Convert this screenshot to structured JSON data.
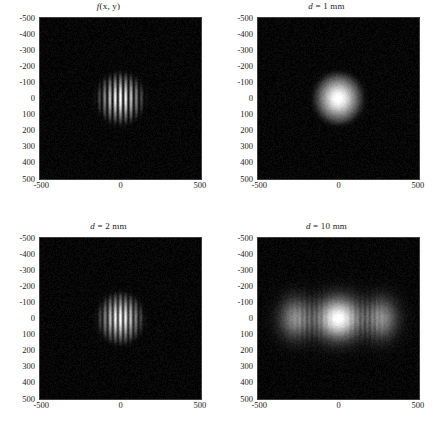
{
  "figure": {
    "layout": "2x2-grid",
    "width": 435,
    "height": 440,
    "background_color": "#ffffff",
    "colormap": "grayscale",
    "axis_color": "#1a1a1a"
  },
  "axes": {
    "x_ticks": [
      "-500",
      "0",
      "500"
    ],
    "x_tick_values": [
      -500,
      0,
      500
    ],
    "y_ticks": [
      "-500",
      "-400",
      "-300",
      "-200",
      "-100",
      "0",
      "100",
      "200",
      "300",
      "400",
      "500"
    ],
    "y_tick_values": [
      -500,
      -400,
      -300,
      -200,
      -100,
      0,
      100,
      200,
      300,
      400,
      500
    ],
    "xlim": [
      -500,
      500
    ],
    "ylim": [
      -500,
      500
    ],
    "y_direction": "inverted",
    "xlabel": "",
    "ylabel": ""
  },
  "panels": [
    {
      "id": "panel-source",
      "title_italic": "f",
      "title_rest": "(x, y)",
      "title": "f(x, y)",
      "description": "source aperture intensity"
    },
    {
      "id": "panel-d1mm",
      "title_italic": "d",
      "title_rest": " = 1 mm",
      "title": "d = 1 mm",
      "description": "propagated field at 1 mm"
    },
    {
      "id": "panel-d2mm",
      "title_italic": "d",
      "title_rest": " = 2 mm",
      "title": "d = 2 mm",
      "description": "propagated field at 2 mm"
    },
    {
      "id": "panel-d10mm",
      "title_italic": "d",
      "title_rest": " = 10 mm",
      "title": "d = 10 mm",
      "description": "propagated field at 10 mm"
    }
  ],
  "chart_data": {
    "type": "heatmap",
    "xlabel": "",
    "ylabel": "",
    "xlim": [
      -500,
      500
    ],
    "ylim": [
      -500,
      500
    ],
    "grid": false,
    "legend": "none",
    "colormap": "gray",
    "value_range": [
      0,
      1
    ],
    "panel_titles": [
      "f(x, y)",
      "d = 1 mm",
      "d = 2 mm",
      "d = 10 mm"
    ],
    "panels": [
      {
        "title": "f(x, y)",
        "model": "gaussian-envelope-times-cosine-fringes",
        "envelope_sigma_x": 75,
        "envelope_sigma_y": 80,
        "envelope_radius_x": 150,
        "envelope_radius_y": 160,
        "fringe_period": 33,
        "fringe_count": 10,
        "fringe_contrast": 0.95,
        "peak_intensity": 1.0,
        "background_noise": 0.03,
        "blur": 0.0
      },
      {
        "title": "d = 1 mm",
        "model": "gaussian-envelope-times-cosine-fringes",
        "envelope_sigma_x": 75,
        "envelope_sigma_y": 80,
        "envelope_radius_x": 150,
        "envelope_radius_y": 160,
        "fringe_period": 33,
        "fringe_count": 9,
        "fringe_contrast": 0.62,
        "peak_intensity": 1.0,
        "background_noise": 0.03,
        "blur": 2.2
      },
      {
        "title": "d = 2 mm",
        "model": "gaussian-envelope-times-cosine-fringes",
        "envelope_sigma_x": 72,
        "envelope_sigma_y": 80,
        "envelope_radius_x": 145,
        "envelope_radius_y": 160,
        "fringe_period": 32,
        "fringe_count": 10,
        "fringe_contrast": 0.9,
        "peak_intensity": 1.0,
        "background_noise": 0.03,
        "blur": 0.6
      },
      {
        "title": "d = 10 mm",
        "model": "three-lobe-spread-with-fringes",
        "envelope_sigma_x": 210,
        "envelope_sigma_y": 78,
        "envelope_radius_x": 420,
        "envelope_radius_y": 155,
        "fringe_period": 30,
        "fringe_count": 16,
        "fringe_contrast": 0.8,
        "peak_intensity": 1.0,
        "side_lobe_offset": 250,
        "side_lobe_intensity": 0.55,
        "background_noise": 0.03,
        "blur": 1.0
      }
    ]
  }
}
